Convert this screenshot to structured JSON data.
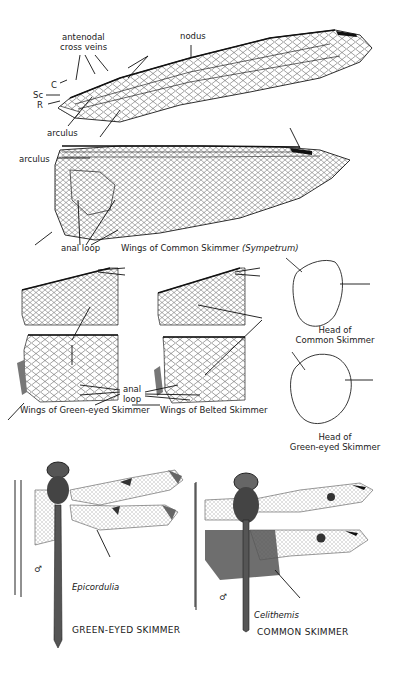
{
  "plate": {
    "section_top": {
      "caption": "Wings of Common Skimmer",
      "caption_genus": "(Sympetrum)",
      "labels": {
        "antenodal": "antenodal",
        "cross_veins": "cross veins",
        "nodus": "nodus",
        "costa": "C",
        "subcosta": "Sc",
        "radius": "R",
        "arculus_fore": "arculus",
        "arculus_hind": "arculus",
        "anal_loop": "anal loop"
      },
      "stigma_color": "#111111"
    },
    "section_middle": {
      "left_caption": "Wings of Green-eyed Skimmer",
      "right_caption": "Wings of Belted Skimmer",
      "anal_label_line1": "anal",
      "anal_label_line2": "loop",
      "head_top_caption_line1": "Head of",
      "head_top_caption_line2": "Common Skimmer",
      "head_bottom_caption_line1": "Head of",
      "head_bottom_caption_line2": "Green-eyed Skimmer"
    },
    "section_bottom": {
      "left": {
        "genus": "Epicordulia",
        "common_name": "GREEN-EYED SKIMMER",
        "sex_symbol": "♂"
      },
      "right": {
        "genus": "Celithemis",
        "common_name": "COMMON SKIMMER",
        "sex_symbol": "♂"
      }
    },
    "colors": {
      "ink": "#1a1a1a",
      "background": "#ffffff",
      "wing_shading": "#8a8a8a"
    }
  }
}
